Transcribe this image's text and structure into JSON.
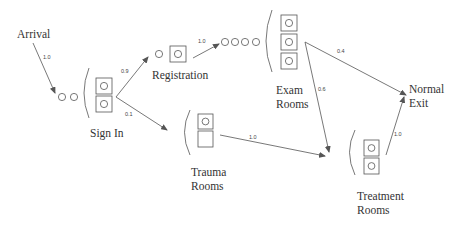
{
  "diagram": {
    "nodes": {
      "arrival": {
        "label": "Arrival"
      },
      "sign_in": {
        "label": "Sign In",
        "queue_slots": 2,
        "servers": 2,
        "busy_servers": 2
      },
      "registration": {
        "label": "Registration",
        "queue_slots": 1,
        "servers": 1,
        "busy_servers": 1
      },
      "exam_rooms": {
        "label_line1": "Exam",
        "label_line2": "Rooms",
        "queue_slots": 4,
        "servers": 3,
        "busy_servers": 3
      },
      "trauma_rooms": {
        "label_line1": "Trauma",
        "label_line2": "Rooms",
        "servers": 2,
        "busy_servers": 1
      },
      "treatment_rooms": {
        "label_line1": "Treatment",
        "label_line2": "Rooms",
        "servers": 2,
        "busy_servers": 2
      },
      "normal_exit": {
        "label_line1": "Normal",
        "label_line2": "Exit"
      }
    },
    "edges": [
      {
        "from": "Arrival",
        "to": "Sign In",
        "probability": "1.0"
      },
      {
        "from": "Sign In",
        "to": "Registration",
        "probability": "0.9"
      },
      {
        "from": "Sign In",
        "to": "Trauma Rooms",
        "probability": "0.1"
      },
      {
        "from": "Registration",
        "to": "Exam Rooms",
        "probability": "1.0"
      },
      {
        "from": "Exam Rooms",
        "to": "Normal Exit",
        "probability": "0.4"
      },
      {
        "from": "Exam Rooms",
        "to": "Treatment Rooms",
        "probability": "0.6"
      },
      {
        "from": "Trauma Rooms",
        "to": "Treatment Rooms",
        "probability": "1.0"
      },
      {
        "from": "Treatment Rooms",
        "to": "Normal Exit",
        "probability": "1.0"
      }
    ],
    "colors": {
      "stroke": "#555555",
      "text": "#333333",
      "background": "#ffffff"
    }
  }
}
